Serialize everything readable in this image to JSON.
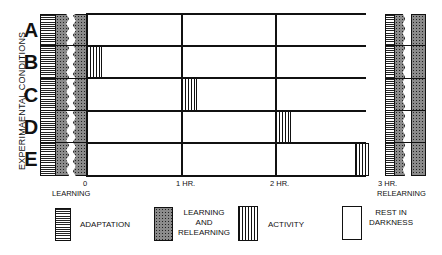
{
  "diagram": {
    "y_axis_label": "EXPERIMAENTAL CONDITIONS",
    "conditions": [
      "A",
      "B",
      "C",
      "D",
      "E"
    ],
    "time_ticks": [
      {
        "label": "0",
        "sub": "LEARNING"
      },
      {
        "label": "1 HR.",
        "sub": ""
      },
      {
        "label": "2 HR.",
        "sub": ""
      },
      {
        "label": "3 HR.",
        "sub": "RELEARNING"
      }
    ],
    "activity_periods": [
      {
        "condition": "A",
        "start_hr": null
      },
      {
        "condition": "B",
        "start_hr": 0
      },
      {
        "condition": "C",
        "start_hr": 1
      },
      {
        "condition": "D",
        "start_hr": 2
      },
      {
        "condition": "E",
        "start_hr": 2.9
      }
    ]
  },
  "legend": {
    "items": [
      {
        "pattern": "adaptation",
        "label": "ADAPTATION"
      },
      {
        "pattern": "learning",
        "label_lines": [
          "LEARNING",
          "AND",
          "RELEARNING"
        ]
      },
      {
        "pattern": "activity",
        "label": "ACTIVITY"
      },
      {
        "pattern": "rest",
        "label_lines": [
          "REST IN",
          "DARKNESS"
        ]
      }
    ]
  }
}
